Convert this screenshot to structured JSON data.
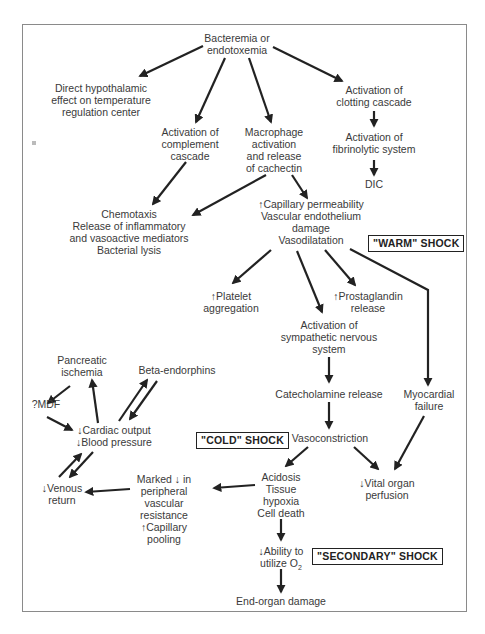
{
  "diagram": {
    "nodes": {
      "bacteremia": [
        "Bacteremia or",
        "endotoxemia"
      ],
      "hypothalamic": [
        "Direct hypothalamic",
        "effect on temperature",
        "regulation center"
      ],
      "complement": [
        "Activation of",
        "complement",
        "cascade"
      ],
      "macrophage": [
        "Macrophage",
        "activation",
        "and release",
        "of cachectin"
      ],
      "clotting": [
        "Activation of",
        "clotting cascade"
      ],
      "fibrinolytic": [
        "Activation of",
        "fibrinolytic system"
      ],
      "dic": [
        "DIC"
      ],
      "chemotaxis": [
        "Chemotaxis",
        "Release of inflammatory",
        "and vasoactive mediators",
        "Bacterial lysis"
      ],
      "capillary": [
        "↑Capillary permeability",
        "Vascular endothelium",
        "damage",
        "Vasodilatation"
      ],
      "platelet": [
        "↑Platelet",
        "aggregation"
      ],
      "prostaglandin": [
        "↑Prostaglandin",
        "release"
      ],
      "sympathetic": [
        "Activation of",
        "sympathetic nervous",
        "system"
      ],
      "catecholamine": [
        "Catecholamine release"
      ],
      "myocardial": [
        "Myocardial",
        "failure"
      ],
      "vasoconstriction": [
        "Vasoconstriction"
      ],
      "pancreatic": [
        "Pancreatic",
        "ischemia"
      ],
      "beta": [
        "Beta-endorphins"
      ],
      "mdf": [
        "?MDF"
      ],
      "cardiac": [
        "↓Cardiac output",
        "↓Blood pressure"
      ],
      "venous": [
        "↓Venous",
        "return"
      ],
      "marked": [
        "Marked ↓ in",
        "peripheral",
        "vascular",
        "resistance",
        "↑Capillary",
        "pooling"
      ],
      "acidosis": [
        "Acidosis",
        "Tissue",
        "hypoxia",
        "Cell death"
      ],
      "vital": [
        "↓Vital organ",
        "perfusion"
      ],
      "ability": [
        "↓Ability to",
        "utilize O"
      ],
      "ability_sub": "2",
      "endorgan": [
        "End-organ damage"
      ]
    },
    "labels": {
      "warm": "\"WARM\" SHOCK",
      "cold": "\"COLD\" SHOCK",
      "secondary": "\"SECONDARY\" SHOCK"
    },
    "colors": {
      "arrow": "#222222",
      "text": "#3a3a3a",
      "frame": "#8a8a8a"
    }
  }
}
